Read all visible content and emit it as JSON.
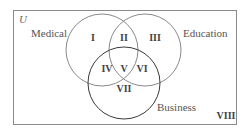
{
  "diagram": {
    "type": "venn",
    "universe": {
      "label": "U"
    },
    "sets": [
      {
        "id": "medical",
        "label": "Medical",
        "stroke": "#8a8a8a"
      },
      {
        "id": "education",
        "label": "Education",
        "stroke": "#8a8a8a"
      },
      {
        "id": "business",
        "label": "Business",
        "stroke": "#3a3a3a"
      }
    ],
    "regions": [
      {
        "label": "I",
        "membership": [
          "Medical"
        ]
      },
      {
        "label": "II",
        "membership": [
          "Medical",
          "Education"
        ]
      },
      {
        "label": "III",
        "membership": [
          "Education"
        ]
      },
      {
        "label": "IV",
        "membership": [
          "Medical",
          "Business"
        ]
      },
      {
        "label": "V",
        "membership": [
          "Medical",
          "Education",
          "Business"
        ]
      },
      {
        "label": "VI",
        "membership": [
          "Education",
          "Business"
        ]
      },
      {
        "label": "VII",
        "membership": [
          "Business"
        ]
      },
      {
        "label": "VIII",
        "membership": []
      }
    ],
    "colors": {
      "border": "#8a8a8a",
      "text": "#444444"
    }
  }
}
